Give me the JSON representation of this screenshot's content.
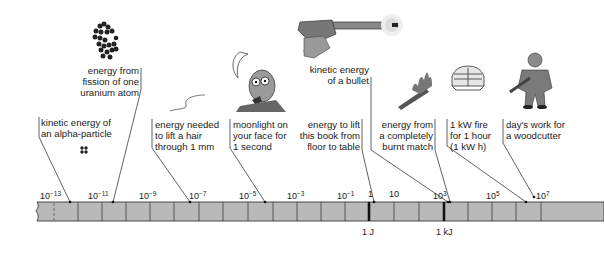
{
  "diagram": {
    "title": "",
    "scale": {
      "ticks": [
        {
          "base": "10",
          "exp": "−13",
          "x": 40
        },
        {
          "base": "10",
          "exp": "−11",
          "x": 88
        },
        {
          "base": "10",
          "exp": "−9",
          "x": 139
        },
        {
          "base": "10",
          "exp": "−7",
          "x": 189
        },
        {
          "base": "10",
          "exp": "−5",
          "x": 239
        },
        {
          "base": "10",
          "exp": "−3",
          "x": 287
        },
        {
          "base": "10",
          "exp": "−1",
          "x": 337
        },
        {
          "base": "1",
          "exp": "",
          "x": 368
        },
        {
          "base": "10",
          "exp": "",
          "x": 389
        },
        {
          "base": "10",
          "exp": "3",
          "x": 433
        },
        {
          "base": "10",
          "exp": "5",
          "x": 486
        },
        {
          "base": "10",
          "exp": "7",
          "x": 533
        }
      ],
      "units": [
        {
          "label": "1 J",
          "x": 362
        },
        {
          "label": "1 kJ",
          "x": 437
        }
      ]
    },
    "annotations": [
      {
        "id": "alpha",
        "text": "kinetic energy of\nan alpha-particle",
        "icon": "alpha-particle-icon"
      },
      {
        "id": "uranium",
        "text": "energy from\nfission of one\nuranium atom",
        "icon": "uranium-nucleus-icon"
      },
      {
        "id": "hair",
        "text": "energy needed\nto lift a hair\nthrough 1 mm",
        "icon": "hair-icon"
      },
      {
        "id": "moonlight",
        "text": "moonlight on\nyour face for\n1 second",
        "icon": "moon-face-icon"
      },
      {
        "id": "book",
        "text": "energy to lift\nthis book from\nfloor to table",
        "icon": ""
      },
      {
        "id": "bullet",
        "text": "kinetic energy\nof a bullet",
        "icon": "pistol-icon"
      },
      {
        "id": "match",
        "text": "energy from\na completely\nburnt match",
        "icon": "burning-match-icon"
      },
      {
        "id": "fire",
        "text": "1 kW fire\nfor 1 hour\n(1 kW h)",
        "icon": "electric-fire-icon"
      },
      {
        "id": "woodcutter",
        "text": "day's work for\na woodcutter",
        "icon": "woodcutter-icon"
      }
    ],
    "colors": {
      "bar_fill": "#b9b9b9",
      "bar_stroke": "#3a3a3a",
      "text": "#1a1a1a",
      "leader": "#3a3a3a"
    }
  }
}
